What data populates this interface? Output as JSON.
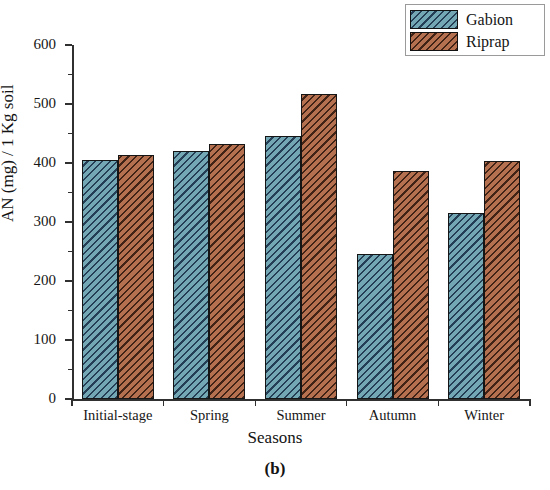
{
  "chart_data": {
    "type": "bar",
    "title": "",
    "panel_label": "(b)",
    "xlabel": "Seasons",
    "ylabel": "AN (mg) / 1 Kg soil",
    "categories": [
      "Initial-stage",
      "Spring",
      "Summer",
      "Autumn",
      "Winter"
    ],
    "series": [
      {
        "name": "Gabion",
        "color": "#74a7b4",
        "values": [
          405,
          420,
          445,
          245,
          315
        ]
      },
      {
        "name": "Riprap",
        "color": "#b5714f",
        "values": [
          413,
          432,
          517,
          387,
          403
        ]
      }
    ],
    "ylim": [
      0,
      600
    ],
    "y_major_ticks": [
      0,
      100,
      200,
      300,
      400,
      500,
      600
    ],
    "y_tick_labels": [
      "0",
      "100",
      "200",
      "300",
      "400",
      "500",
      "600"
    ],
    "y_minor_ticks": [
      50,
      150,
      250,
      350,
      450,
      550
    ],
    "grid": false,
    "legend_position": "top-right-outside"
  }
}
